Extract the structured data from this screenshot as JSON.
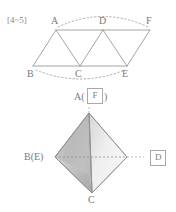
{
  "problem_tag": "[4~5]",
  "colors": {
    "stroke": "#9a9a9a",
    "label_text": "#7a7a7a",
    "box_border": "#a9a9a9",
    "face_left_light": "#f2f2f2",
    "face_left_mid": "#cfcfcf",
    "face_center_dark": "#9e9e9e",
    "face_right_light": "#efefef",
    "dashed": "#9a9a9a",
    "tag_text": "#9c9c9c"
  },
  "net_figure": {
    "name": "triangle-strip-net",
    "vertices": {
      "A": {
        "label": "A",
        "x": 56,
        "y": 30,
        "lx": 51,
        "ly": 18
      },
      "D": {
        "label": "D",
        "x": 103,
        "y": 30,
        "lx": 99,
        "ly": 18
      },
      "F": {
        "label": "F",
        "x": 150,
        "y": 30,
        "lx": 146,
        "ly": 18
      },
      "B": {
        "label": "B",
        "x": 33,
        "y": 66,
        "lx": 28,
        "ly": 68
      },
      "C": {
        "label": "C",
        "x": 80,
        "y": 66,
        "lx": 75,
        "ly": 68
      },
      "E": {
        "label": "E",
        "x": 127,
        "y": 66,
        "lx": 122,
        "ly": 68
      }
    },
    "edges": [
      "A-D",
      "D-F",
      "B-C",
      "C-E",
      "A-B",
      "A-C",
      "D-C",
      "D-E",
      "F-E"
    ],
    "arcs": [
      {
        "name": "arc-top-A-to-F",
        "from": "A",
        "to": "F",
        "style": "dotted",
        "bulge": "up"
      },
      {
        "name": "arc-bottom-B-to-E",
        "from": "B",
        "to": "E",
        "style": "dotted",
        "bulge": "down"
      }
    ]
  },
  "solid_figure": {
    "name": "tetrahedron",
    "apex_label_prefix": "A(",
    "apex_label_suffix": ")",
    "apex_box_label": "F",
    "left_label": "B(E)",
    "bottom_label": "C",
    "right_box_label": "D",
    "vertices": {
      "apex": {
        "x": 89,
        "y": 113
      },
      "left": {
        "x": 55,
        "y": 157
      },
      "right": {
        "x": 127,
        "y": 157
      },
      "bottom": {
        "x": 92,
        "y": 193
      }
    },
    "hidden_edge": {
      "name": "hidden-edge-left-right",
      "style": "dashed"
    }
  }
}
